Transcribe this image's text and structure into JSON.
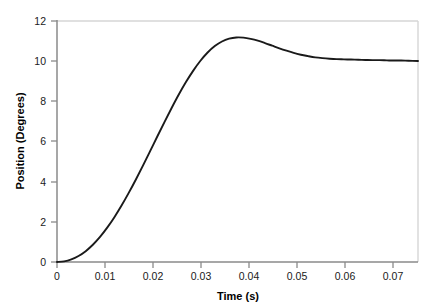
{
  "chart_data": {
    "type": "line",
    "title": "",
    "xlabel": "Time (s)",
    "ylabel": "Position (Degrees)",
    "xlim": [
      0,
      0.0755
    ],
    "ylim": [
      0,
      12
    ],
    "grid": false,
    "legend": null,
    "xticks": [
      0,
      0.01,
      0.02,
      0.03,
      0.04,
      0.05,
      0.06,
      0.07
    ],
    "xticklabels": [
      "0",
      "0.01",
      "0.02",
      "0.03",
      "0.04",
      "0.05",
      "0.06",
      "0.07"
    ],
    "yticks": [
      0,
      2,
      4,
      6,
      8,
      10,
      12
    ],
    "yticklabels": [
      "0",
      "2",
      "4",
      "6",
      "8",
      "10",
      "12"
    ],
    "line_color": "#1a1a1a",
    "line_width": 1.9,
    "axis_color": "#8a8a8a",
    "frame_color": "#d6d6d6",
    "background": "#ffffff",
    "series": [
      {
        "name": "Position",
        "x": [
          0,
          0.0015,
          0.003,
          0.0045,
          0.006,
          0.0075,
          0.009,
          0.0105,
          0.012,
          0.0135,
          0.015,
          0.0165,
          0.018,
          0.0195,
          0.021,
          0.0225,
          0.024,
          0.0255,
          0.027,
          0.0285,
          0.03,
          0.0315,
          0.033,
          0.0345,
          0.036,
          0.0375,
          0.039,
          0.0405,
          0.042,
          0.0435,
          0.045,
          0.0465,
          0.048,
          0.0495,
          0.051,
          0.0525,
          0.054,
          0.0555,
          0.057,
          0.0585,
          0.06,
          0.0615,
          0.063,
          0.0645,
          0.066,
          0.0675,
          0.069,
          0.0705,
          0.072,
          0.0735,
          0.0755
        ],
        "y": [
          0.0,
          0.03,
          0.13,
          0.3,
          0.54,
          0.86,
          1.25,
          1.71,
          2.23,
          2.81,
          3.44,
          4.11,
          4.81,
          5.53,
          6.26,
          6.98,
          7.68,
          8.35,
          8.97,
          9.53,
          10.02,
          10.43,
          10.75,
          10.98,
          11.12,
          11.18,
          11.17,
          11.11,
          11.02,
          10.9,
          10.77,
          10.64,
          10.52,
          10.41,
          10.32,
          10.25,
          10.19,
          10.15,
          10.12,
          10.1,
          10.09,
          10.08,
          10.07,
          10.06,
          10.05,
          10.05,
          10.04,
          10.03,
          10.03,
          10.02,
          10.01
        ]
      }
    ],
    "annotations": {
      "peak_value": 11.18,
      "peak_time": 0.0375,
      "steady_state": 10.0,
      "initial_value": 0.0
    }
  },
  "axes": {
    "x_title": "Time (s)",
    "y_title": "Position (Degrees)"
  }
}
